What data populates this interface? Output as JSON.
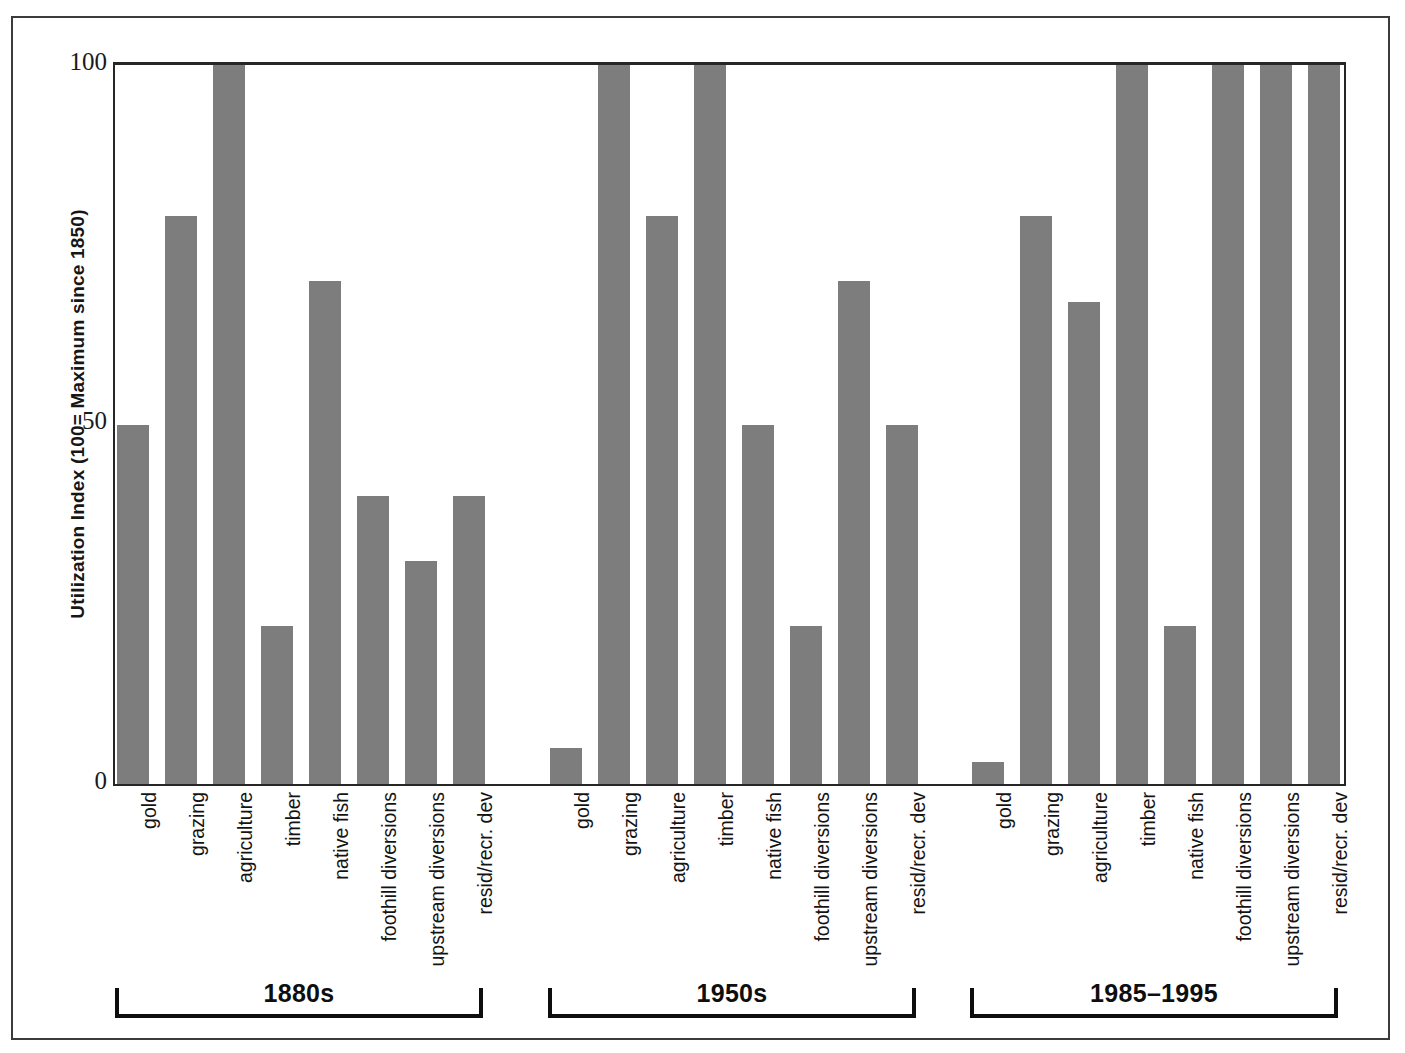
{
  "chart_data": {
    "type": "bar",
    "title": "",
    "xlabel": "",
    "ylabel": "Utilization Index (100= Maximum since 1850)",
    "ylim": [
      0,
      100
    ],
    "yticks": [
      0,
      50,
      100
    ],
    "grid": false,
    "legend": "none",
    "bar_color": "#7d7d7d",
    "axis_color": "#262626",
    "categories": [
      "gold",
      "grazing",
      "agriculture",
      "timber",
      "native fish",
      "foothill diversions",
      "upstream diversions",
      "resid/recr. dev"
    ],
    "group_labels": [
      "1880s",
      "1950s",
      "1985–1995"
    ],
    "series": [
      {
        "name": "1880s",
        "values": [
          50,
          79,
          100,
          22,
          70,
          40,
          31,
          40
        ]
      },
      {
        "name": "1950s",
        "values": [
          5,
          100,
          79,
          100,
          50,
          22,
          70,
          50
        ]
      },
      {
        "name": "1985–1995",
        "values": [
          3,
          79,
          67,
          100,
          22,
          100,
          100,
          100
        ]
      }
    ]
  },
  "axis": {
    "y_tick_labels": [
      "100",
      "50",
      "0"
    ],
    "y_title": "Utilization Index (100= Maximum since 1850)"
  }
}
